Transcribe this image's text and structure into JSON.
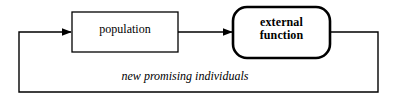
{
  "diagram": {
    "type": "flowchart",
    "background_color": "#ffffff",
    "stroke_color": "#000000",
    "nodes": [
      {
        "id": "population",
        "label": "population",
        "shape": "rectangle",
        "bold": false,
        "x": 72,
        "y": 12,
        "width": 106,
        "height": 40,
        "border_width": 1
      },
      {
        "id": "external-function",
        "label": "external\nfunction",
        "shape": "rounded-rectangle",
        "bold": true,
        "x": 233,
        "y": 7,
        "width": 97,
        "height": 51,
        "corner_radius": 14,
        "border_width": 2.4
      }
    ],
    "edges": [
      {
        "id": "population-to-external-function",
        "from": "population",
        "to": "external-function",
        "label": "",
        "arrowhead": true
      },
      {
        "id": "feedback-loop",
        "from": "external-function",
        "to": "population",
        "label": "new promising individuals",
        "label_style": "italic",
        "arrowhead": true
      }
    ]
  }
}
